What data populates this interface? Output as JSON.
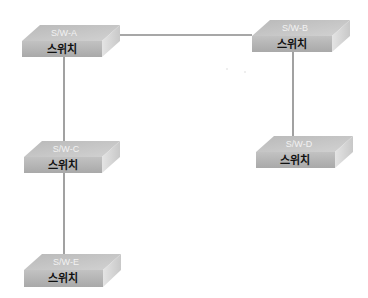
{
  "diagram": {
    "type": "network-topology",
    "colors": {
      "link": "#8a8a8a",
      "top_face": "#c4c4c4",
      "front_face": "#b6b6b6",
      "side_face": "#d9d9d9",
      "top_label": "#f2f2f2",
      "front_label": "#111111"
    },
    "nodes": [
      {
        "id": "A",
        "name": "S/W-A",
        "label": "스위치"
      },
      {
        "id": "B",
        "name": "S/W-B",
        "label": "스위치"
      },
      {
        "id": "C",
        "name": "S/W-C",
        "label": "스위치"
      },
      {
        "id": "D",
        "name": "S/W-D",
        "label": "스위치"
      },
      {
        "id": "E",
        "name": "S/W-E",
        "label": "스위치"
      }
    ],
    "links": [
      {
        "from": "A",
        "to": "B"
      },
      {
        "from": "A",
        "to": "C"
      },
      {
        "from": "B",
        "to": "D"
      },
      {
        "from": "C",
        "to": "E"
      }
    ]
  }
}
